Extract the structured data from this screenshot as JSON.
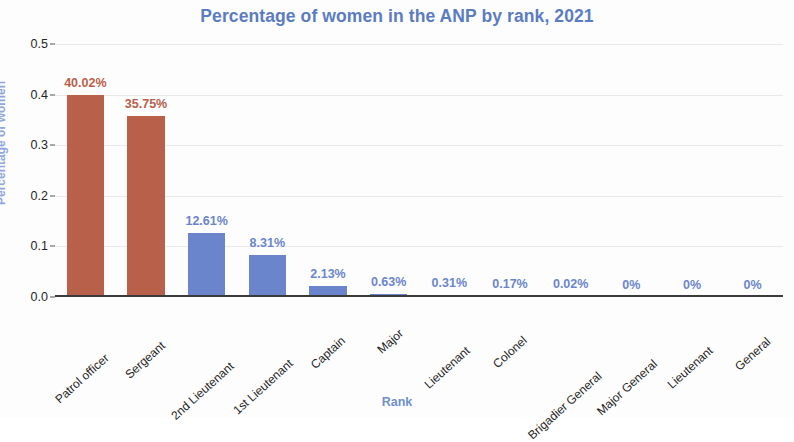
{
  "chart_data": {
    "type": "bar",
    "title": "Percentage of women in the ANP by rank, 2021",
    "xlabel": "Rank",
    "ylabel": "Percentage of women",
    "grid": true,
    "legend": null,
    "ylim": [
      0.0,
      0.5
    ],
    "ytick_labels": [
      "0.0",
      "0.1",
      "0.2",
      "0.3",
      "0.4",
      "0.5"
    ],
    "ytick_values": [
      0.0,
      0.1,
      0.2,
      0.3,
      0.4,
      0.5
    ],
    "categories": [
      "Patrol officer",
      "Sergeant",
      "2nd Lieutenant",
      "1st Lieutenant",
      "Captain",
      "Major",
      "Lieutenant",
      "Colonel",
      "Brigadier General",
      "Major General",
      "Lieutenant",
      "General"
    ],
    "values": [
      0.4002,
      0.3575,
      0.1261,
      0.0831,
      0.0213,
      0.0063,
      0.0031,
      0.0017,
      0.0002,
      0.0,
      0.0,
      0.0
    ],
    "data_labels": [
      "40.02%",
      "35.75%",
      "12.61%",
      "8.31%",
      "2.13%",
      "0.63%",
      "0.31%",
      "0.17%",
      "0.02%",
      "0%",
      "0%",
      "0%"
    ],
    "bar_colors": [
      "#b8604a",
      "#b8604a",
      "#6b85cc",
      "#6b85cc",
      "#6b85cc",
      "#6b85cc",
      "#6b85cc",
      "#6b85cc",
      "#6b85cc",
      "#6b85cc",
      "#6b85cc",
      "#6b85cc"
    ],
    "label_colors": [
      "#b8604a",
      "#b8604a",
      "#6b85cc",
      "#6b85cc",
      "#6b85cc",
      "#6b85cc",
      "#6b85cc",
      "#6b85cc",
      "#6b85cc",
      "#6b85cc",
      "#6b85cc",
      "#6b85cc"
    ],
    "colors": {
      "title": "#5b7cc2",
      "axis_title": "#6f8fd0",
      "yaxis_title": "#8fa7dc",
      "series_highlight": "#b8604a",
      "series_default": "#6b85cc",
      "gridline": "#e9e9e9",
      "axis_line": "#3a3a3a",
      "tick_text": "#262626"
    }
  }
}
